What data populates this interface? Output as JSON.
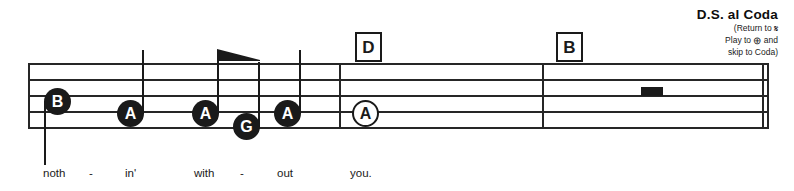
{
  "score": {
    "staff": {
      "line_count": 5,
      "left": 28,
      "right": 768
    },
    "rehearsal_marks": [
      {
        "label": "D",
        "x": 355
      },
      {
        "label": "B",
        "x": 556
      }
    ],
    "notes": [
      {
        "pitch": "B",
        "x": 44,
        "y": 88,
        "head": "filled",
        "stem": "down"
      },
      {
        "pitch": "A",
        "x": 117,
        "y": 100,
        "head": "filled",
        "stem": "up"
      },
      {
        "pitch": "A",
        "x": 192,
        "y": 100,
        "head": "filled",
        "stem": "up",
        "beam": "start"
      },
      {
        "pitch": "G",
        "x": 233,
        "y": 113,
        "head": "filled",
        "stem": "up",
        "beam": "end"
      },
      {
        "pitch": "A",
        "x": 274,
        "y": 100,
        "head": "filled",
        "stem": "up"
      },
      {
        "pitch": "A",
        "x": 352,
        "y": 100,
        "head": "hollow",
        "stem": "none"
      }
    ],
    "rests": [
      {
        "type": "whole",
        "x": 641,
        "y": 87
      }
    ],
    "final_barline": "double",
    "lyrics": [
      {
        "text": "noth",
        "x": 43
      },
      {
        "text": "-",
        "x": 89
      },
      {
        "text": "in'",
        "x": 125
      },
      {
        "text": "with",
        "x": 194
      },
      {
        "text": "-",
        "x": 240
      },
      {
        "text": "out",
        "x": 277
      },
      {
        "text": "you.",
        "x": 350
      }
    ]
  },
  "annotation": {
    "title": "D.S. al Coda",
    "line1_prefix": "(Return to ",
    "line1_glyph": "𝄋",
    "line2_prefix": "Play to ",
    "line2_glyph": "⊕",
    "line2_suffix": " and",
    "line3": "skip to Coda)"
  }
}
